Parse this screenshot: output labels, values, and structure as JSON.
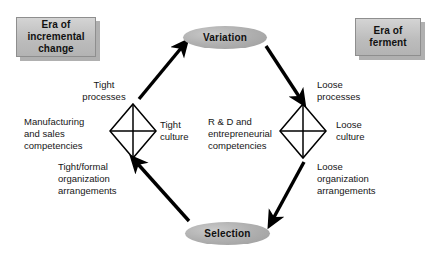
{
  "diagram": {
    "colors": {
      "box_fill": "#bdbdbd",
      "box_border": "#8e8e8e",
      "box_shadow": "#969696",
      "ellipse_fill": "#b0b0b0",
      "stroke": "#000000",
      "text": "#111111",
      "background": "#ffffff"
    },
    "era_boxes": [
      {
        "id": "incremental",
        "label": "Era of\nincremental\nchange"
      },
      {
        "id": "ferment",
        "label": "Era of\nferment"
      }
    ],
    "nodes": [
      {
        "id": "variation",
        "label": "Variation",
        "shape": "ellipse"
      },
      {
        "id": "selection",
        "label": "Selection",
        "shape": "ellipse"
      }
    ],
    "diamonds": [
      {
        "id": "tight",
        "shape": "diamond",
        "labels": {
          "top": "Tight\nprocesses",
          "left": "Manufacturing\nand sales\ncompetencies",
          "right": "Tight\nculture",
          "bottom": "Tight/formal\norganization\narrangements"
        }
      },
      {
        "id": "loose",
        "shape": "diamond",
        "labels": {
          "top": "Loose\nprocesses",
          "left": "R & D and\nentrepreneurial\ncompetencies",
          "right": "Loose\nculture",
          "bottom": "Loose\norganization\narrangements"
        }
      }
    ],
    "arrows": [
      {
        "id": "tight-to-variation",
        "from": "tight-diamond",
        "to": "variation"
      },
      {
        "id": "variation-to-loose",
        "from": "variation",
        "to": "loose-diamond"
      },
      {
        "id": "loose-to-selection",
        "from": "loose-diamond",
        "to": "selection"
      },
      {
        "id": "selection-to-tight",
        "from": "selection",
        "to": "tight-diamond"
      }
    ]
  }
}
